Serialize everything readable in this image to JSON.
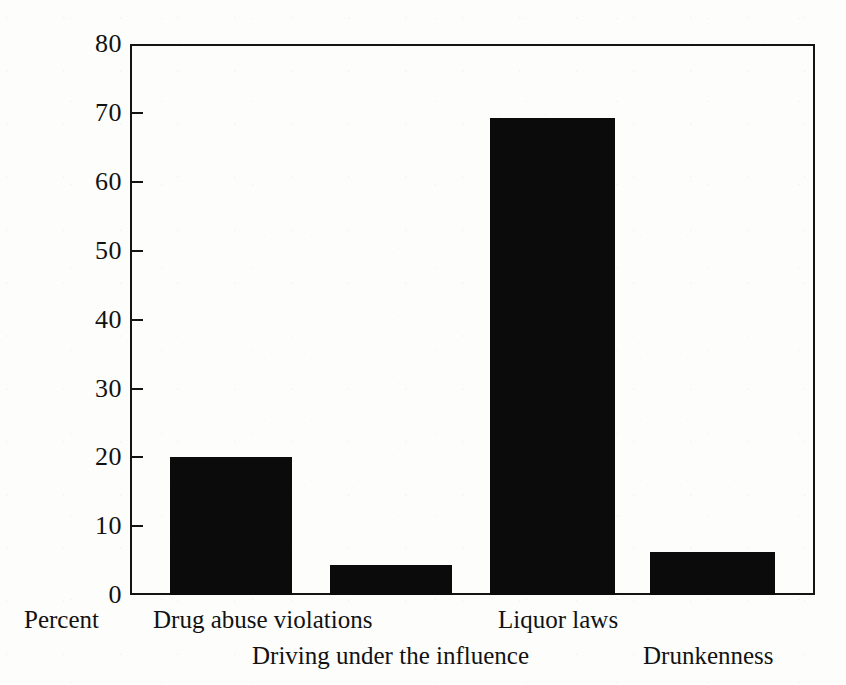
{
  "chart_data": {
    "type": "bar",
    "title": "",
    "subtitle": "",
    "xlabel": "",
    "ylabel": "Percent",
    "ylim": [
      0,
      80
    ],
    "ytick_values": [
      0,
      10,
      20,
      30,
      40,
      50,
      60,
      70,
      80
    ],
    "ytick_labels": [
      "0",
      "10",
      "20",
      "30",
      "40",
      "50",
      "60",
      "70",
      "80"
    ],
    "grid": false,
    "legend": false,
    "legend_position": "none",
    "orientation": "vertical",
    "bar_color": "#0b0b0b",
    "background_color": "#fdfdfc",
    "axis_color": "#141414",
    "categories": [
      "Drug abuse violations",
      "Driving under the influence",
      "Liquor laws",
      "Drunkenness"
    ],
    "values": [
      20.0,
      4.3,
      69.2,
      6.3
    ],
    "label_rows": [
      0,
      1,
      0,
      1
    ],
    "annotations": []
  },
  "axis": {
    "y_title": "Percent"
  },
  "labels": {
    "cat0": "Drug abuse violations",
    "cat1": "Driving under the influence",
    "cat2": "Liquor laws",
    "cat3": "Drunkenness"
  },
  "ticks": {
    "t0": "0",
    "t10": "10",
    "t20": "20",
    "t30": "30",
    "t40": "40",
    "t50": "50",
    "t60": "60",
    "t70": "70",
    "t80": "80"
  }
}
